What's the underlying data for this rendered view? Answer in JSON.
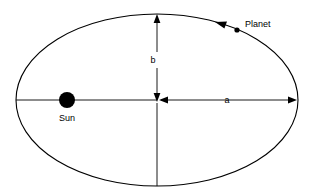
{
  "diagram": {
    "title": "Elliptical planetary orbit with semi-major axis a and semi-minor axis b",
    "background_color": "#ffffff",
    "stroke_color": "#000000",
    "labels": {
      "sun": "Sun",
      "planet": "Planet",
      "semi_major_axis": "a",
      "semi_minor_axis": "b"
    },
    "geometry": {
      "ellipse_center_x": 157,
      "ellipse_center_y": 100,
      "semi_major_px": 141,
      "semi_minor_px": 86,
      "sun_center_x": 67,
      "sun_center_y": 100,
      "sun_radius_px": 8,
      "planet_center_x": 237,
      "planet_center_y": 30,
      "planet_radius_px": 2.6
    },
    "icons": {
      "sun_body": "sun-filled-circle-icon",
      "planet_body": "planet-filled-circle-icon",
      "orbit_direction": "orbit-direction-arrow-icon",
      "axis_arrow_right": "arrow-right-icon",
      "axis_arrow_up": "arrow-up-icon",
      "axis_arrow_down": "arrow-down-icon",
      "axis_arrow_left": "arrow-left-icon"
    }
  }
}
